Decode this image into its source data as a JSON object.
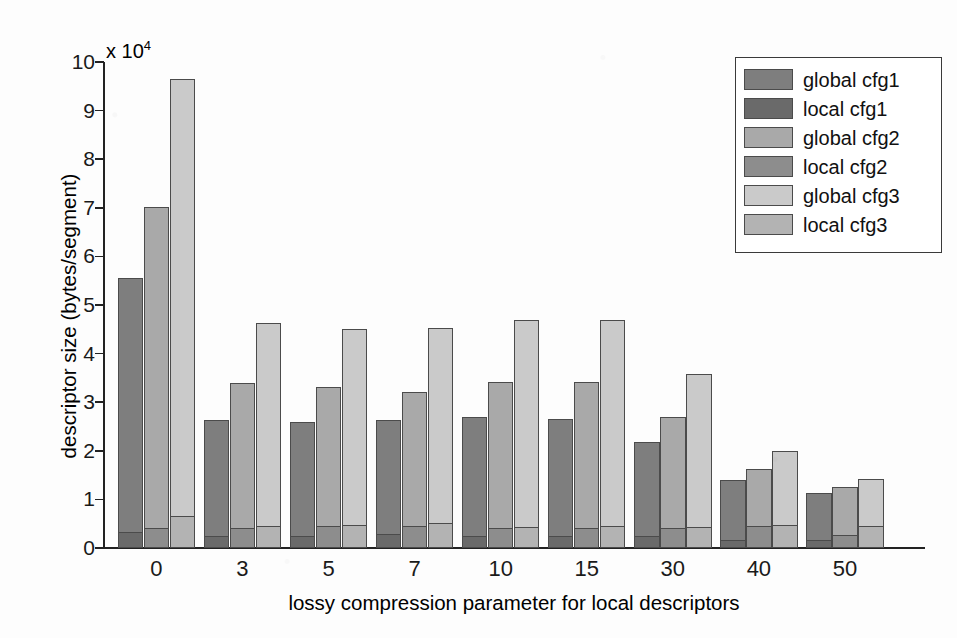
{
  "chart_data": {
    "type": "bar",
    "subtype": "grouped-stacked",
    "title": "",
    "xlabel": "lossy compression parameter for local descriptors",
    "ylabel": "descriptor size (bytes/segment)",
    "y_exponent_label": "x 10",
    "y_exponent_sup": "4",
    "y_scale_factor": 10000,
    "ylim": [
      0,
      10
    ],
    "ytick_labels": [
      "0",
      "1",
      "2",
      "3",
      "4",
      "5",
      "6",
      "7",
      "8",
      "9",
      "10"
    ],
    "ytick_values": [
      0,
      1,
      2,
      3,
      4,
      5,
      6,
      7,
      8,
      9,
      10
    ],
    "grid": false,
    "legend_position": "top-right",
    "categories": [
      "0",
      "3",
      "5",
      "7",
      "10",
      "15",
      "30",
      "40",
      "50"
    ],
    "xtick_labels": [
      "0",
      "3",
      "5",
      "7",
      "10",
      "15",
      "30",
      "40",
      "50"
    ],
    "series": [
      {
        "name": "global cfg1",
        "color": "#7e7e7e",
        "values": [
          5.25,
          2.42,
          2.38,
          2.37,
          2.47,
          2.44,
          1.96,
          1.25,
          1.0
        ]
      },
      {
        "name": "local cfg1",
        "color": "#6a6a6a",
        "values": [
          0.3,
          0.22,
          0.22,
          0.26,
          0.22,
          0.22,
          0.22,
          0.14,
          0.14
        ]
      },
      {
        "name": "global cfg2",
        "color": "#a9a9a9",
        "values": [
          6.62,
          3.0,
          2.88,
          2.78,
          3.02,
          3.02,
          2.3,
          1.18,
          1.0
        ]
      },
      {
        "name": "local cfg2",
        "color": "#8d8d8d",
        "values": [
          0.4,
          0.4,
          0.43,
          0.44,
          0.4,
          0.4,
          0.4,
          0.44,
          0.25
        ]
      },
      {
        "name": "global cfg3",
        "color": "#cacaca",
        "values": [
          9.02,
          4.18,
          4.05,
          4.03,
          4.28,
          4.26,
          3.16,
          1.55,
          1.0
        ]
      },
      {
        "name": "local cfg3",
        "color": "#b3b3b3",
        "values": [
          0.63,
          0.44,
          0.45,
          0.5,
          0.42,
          0.43,
          0.42,
          0.45,
          0.43
        ]
      }
    ],
    "stacks": [
      {
        "label": "cfg1",
        "top_series": "global cfg1",
        "bottom_series": "local cfg1",
        "totals": [
          5.55,
          2.64,
          2.6,
          2.63,
          2.69,
          2.66,
          2.18,
          1.39,
          1.14
        ]
      },
      {
        "label": "cfg2",
        "top_series": "global cfg2",
        "bottom_series": "local cfg2",
        "totals": [
          7.02,
          3.4,
          3.31,
          3.22,
          3.42,
          3.42,
          2.7,
          1.62,
          1.25
        ]
      },
      {
        "label": "cfg3",
        "top_series": "global cfg3",
        "bottom_series": "local cfg3",
        "totals": [
          9.65,
          4.62,
          4.5,
          4.53,
          4.7,
          4.69,
          3.58,
          2.0,
          1.43
        ]
      }
    ]
  },
  "legend": {
    "items": [
      {
        "label": "global cfg1",
        "color": "#7e7e7e"
      },
      {
        "label": "local cfg1",
        "color": "#6a6a6a"
      },
      {
        "label": "global cfg2",
        "color": "#a9a9a9"
      },
      {
        "label": "local cfg2",
        "color": "#8d8d8d"
      },
      {
        "label": "global cfg3",
        "color": "#cacaca"
      },
      {
        "label": "local cfg3",
        "color": "#b3b3b3"
      }
    ]
  },
  "axes": {
    "y_title": "descriptor size (bytes/segment)",
    "x_title": "lossy compression parameter for local descriptors",
    "y_multiplier_prefix": "x 10",
    "y_multiplier_exponent": "4"
  }
}
